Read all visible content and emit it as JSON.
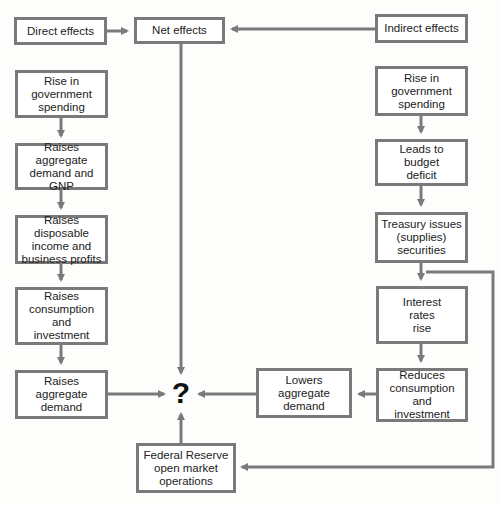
{
  "diagram": {
    "header": {
      "direct": "Direct effects",
      "net": "Net effects",
      "indirect": "Indirect effects"
    },
    "left_chain": [
      "Rise in\ngovernment\nspending",
      "Raises aggregate\ndemand and\nGNP",
      "Raises disposable\nincome and\nbusiness profits",
      "Raises\nconsumption\nand\ninvestment",
      "Raises\naggregate\ndemand"
    ],
    "right_chain": [
      "Rise in\ngovernment\nspending",
      "Leads to\nbudget\ndeficit",
      "Treasury issues\n(supplies)\nsecurities",
      "Interest\nrates\nrise",
      "Reduces\nconsumption\nand\ninvestment"
    ],
    "lowers": "Lowers\naggregate\ndemand",
    "fed": "Federal Reserve\nopen market\noperations",
    "outcome": "?"
  },
  "colors": {
    "line": "#7a7a7a",
    "text": "#222222",
    "background": "#fdfdfb"
  }
}
